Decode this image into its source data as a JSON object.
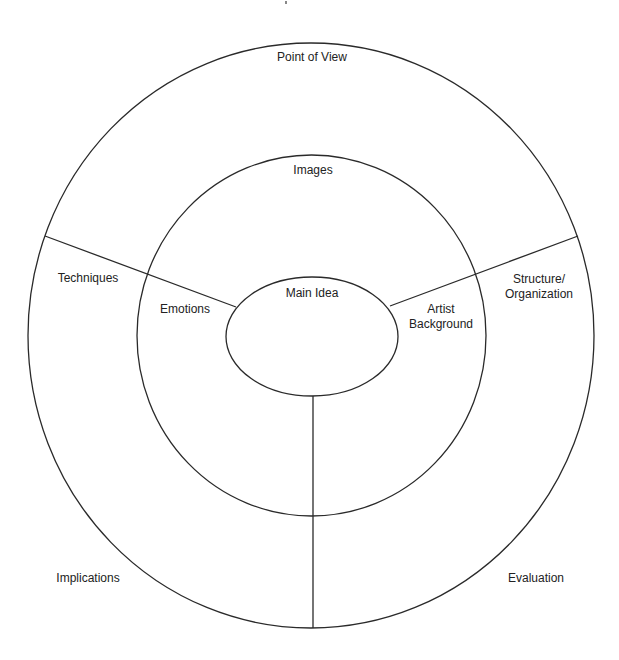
{
  "diagram": {
    "type": "concentric-circle-organizer",
    "colors": {
      "stroke": "#2a2a2a",
      "text": "#222222",
      "background": "#ffffff"
    },
    "center": {
      "label": "Main Idea"
    },
    "inner_ring": {
      "top_label": "Images",
      "left_label": "Emotions",
      "right_label_line1": "Artist",
      "right_label_line2": "Background"
    },
    "outer_ring": {
      "top_label": "Point of View",
      "left_label": "Techniques",
      "right_label_line1": "Structure/",
      "right_label_line2": "Organization",
      "bottom_left_label": "Implications",
      "bottom_right_label": "Evaluation"
    }
  }
}
